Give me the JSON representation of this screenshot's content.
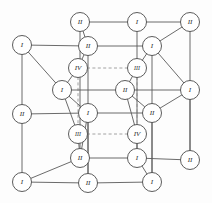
{
  "figure": {
    "background_color": "#fdfdfd",
    "edge_color": "#5a5a5a",
    "dashed_edge_color": "#8a8a8a",
    "node_fill": "#ffffff",
    "node_stroke": "#4a4a4a",
    "label_color": "#2b2b2b"
  },
  "chart_data": {
    "type": "diagram",
    "xlabel": "",
    "ylabel": "",
    "nodes": [
      {
        "id": "n01",
        "label": "II",
        "x": 80,
        "y": 22,
        "r": 9.5,
        "group": "outer-top-back-left"
      },
      {
        "id": "n02",
        "label": "I",
        "x": 137,
        "y": 22,
        "r": 9.5,
        "group": "outer-top-back-center"
      },
      {
        "id": "n03",
        "label": "II",
        "x": 190,
        "y": 22,
        "r": 9.5,
        "group": "outer-top-back-right"
      },
      {
        "id": "n04",
        "label": "I",
        "x": 22,
        "y": 45,
        "r": 9.5,
        "group": "outer-top-front-left"
      },
      {
        "id": "n05",
        "label": "II",
        "x": 88,
        "y": 46,
        "r": 9.5,
        "group": "outer-top-front-center"
      },
      {
        "id": "n06",
        "label": "I",
        "x": 152,
        "y": 46,
        "r": 9.5,
        "group": "outer-top-front-right"
      },
      {
        "id": "n07",
        "label": "IV",
        "x": 78,
        "y": 68,
        "r": 9.5,
        "group": "inner-top-back-left"
      },
      {
        "id": "n08",
        "label": "III",
        "x": 137,
        "y": 68,
        "r": 9.5,
        "group": "inner-top-back-right"
      },
      {
        "id": "n09",
        "label": "I",
        "x": 62,
        "y": 90,
        "r": 9.5,
        "group": "inner-mid-back-left"
      },
      {
        "id": "n10",
        "label": "II",
        "x": 125,
        "y": 90,
        "r": 9.5,
        "group": "inner-mid-back-right"
      },
      {
        "id": "n11",
        "label": "I",
        "x": 190,
        "y": 90,
        "r": 9.5,
        "group": "outer-mid-back-right"
      },
      {
        "id": "n12",
        "label": "II",
        "x": 22,
        "y": 114,
        "r": 9.5,
        "group": "outer-mid-front-left"
      },
      {
        "id": "n13",
        "label": "I",
        "x": 88,
        "y": 113,
        "r": 9.5,
        "group": "inner-mid-front-center"
      },
      {
        "id": "n14",
        "label": "II",
        "x": 152,
        "y": 113,
        "r": 9.5,
        "group": "outer-mid-front-right"
      },
      {
        "id": "n15",
        "label": "III",
        "x": 78,
        "y": 134,
        "r": 9.5,
        "group": "inner-bottom-back-left"
      },
      {
        "id": "n16",
        "label": "IV",
        "x": 137,
        "y": 134,
        "r": 9.5,
        "group": "inner-bottom-back-right"
      },
      {
        "id": "n17",
        "label": "II",
        "x": 80,
        "y": 158,
        "r": 9.5,
        "group": "outer-bottom-back-left"
      },
      {
        "id": "n18",
        "label": "I",
        "x": 137,
        "y": 158,
        "r": 9.5,
        "group": "outer-bottom-back-center"
      },
      {
        "id": "n19",
        "label": "II",
        "x": 190,
        "y": 160,
        "r": 9.5,
        "group": "outer-bottom-back-right"
      },
      {
        "id": "n20",
        "label": "I",
        "x": 22,
        "y": 182,
        "r": 9.5,
        "group": "outer-bottom-front-left"
      },
      {
        "id": "n21",
        "label": "II",
        "x": 88,
        "y": 183,
        "r": 9.5,
        "group": "outer-bottom-front-center"
      },
      {
        "id": "n22",
        "label": "I",
        "x": 152,
        "y": 182,
        "r": 9.5,
        "group": "outer-bottom-front-right"
      }
    ],
    "edges": [
      {
        "from": "n01",
        "to": "n02",
        "style": "solid"
      },
      {
        "from": "n02",
        "to": "n03",
        "style": "solid"
      },
      {
        "from": "n01",
        "to": "n05",
        "style": "solid"
      },
      {
        "from": "n04",
        "to": "n05",
        "style": "solid"
      },
      {
        "from": "n05",
        "to": "n06",
        "style": "solid"
      },
      {
        "from": "n06",
        "to": "n03",
        "style": "solid"
      },
      {
        "from": "n04",
        "to": "n12",
        "style": "solid"
      },
      {
        "from": "n12",
        "to": "n20",
        "style": "solid"
      },
      {
        "from": "n01",
        "to": "n17",
        "style": "solid"
      },
      {
        "from": "n02",
        "to": "n18",
        "style": "solid"
      },
      {
        "from": "n03",
        "to": "n19",
        "style": "solid"
      },
      {
        "from": "n05",
        "to": "n21",
        "style": "solid"
      },
      {
        "from": "n06",
        "to": "n22",
        "style": "solid"
      },
      {
        "from": "n11",
        "to": "n19",
        "style": "solid"
      },
      {
        "from": "n17",
        "to": "n18",
        "style": "solid"
      },
      {
        "from": "n18",
        "to": "n19",
        "style": "solid"
      },
      {
        "from": "n20",
        "to": "n21",
        "style": "solid"
      },
      {
        "from": "n21",
        "to": "n22",
        "style": "solid"
      },
      {
        "from": "n20",
        "to": "n17",
        "style": "solid"
      },
      {
        "from": "n22",
        "to": "n18",
        "style": "solid"
      },
      {
        "from": "n07",
        "to": "n08",
        "style": "dashed"
      },
      {
        "from": "n15",
        "to": "n16",
        "style": "dashed"
      },
      {
        "from": "n07",
        "to": "n15",
        "style": "dashed"
      },
      {
        "from": "n08",
        "to": "n16",
        "style": "dashed"
      },
      {
        "from": "n09",
        "to": "n10",
        "style": "solid"
      },
      {
        "from": "n10",
        "to": "n11",
        "style": "solid"
      },
      {
        "from": "n09",
        "to": "n13",
        "style": "solid"
      },
      {
        "from": "n13",
        "to": "n14",
        "style": "solid"
      },
      {
        "from": "n10",
        "to": "n14",
        "style": "solid"
      },
      {
        "from": "n12",
        "to": "n13",
        "style": "solid"
      },
      {
        "from": "n04",
        "to": "n09",
        "style": "solid"
      },
      {
        "from": "n09",
        "to": "n15",
        "style": "solid"
      },
      {
        "from": "n07",
        "to": "n09",
        "style": "solid"
      },
      {
        "from": "n10",
        "to": "n08",
        "style": "solid"
      },
      {
        "from": "n10",
        "to": "n16",
        "style": "solid"
      },
      {
        "from": "n05",
        "to": "n07",
        "style": "solid"
      },
      {
        "from": "n06",
        "to": "n08",
        "style": "solid"
      },
      {
        "from": "n13",
        "to": "n21",
        "style": "solid"
      },
      {
        "from": "n15",
        "to": "n17",
        "style": "solid"
      },
      {
        "from": "n16",
        "to": "n18",
        "style": "solid"
      },
      {
        "from": "n14",
        "to": "n22",
        "style": "solid"
      },
      {
        "from": "n11",
        "to": "n06",
        "style": "solid"
      },
      {
        "from": "n13",
        "to": "n17",
        "style": "solid"
      },
      {
        "from": "n14",
        "to": "n11",
        "style": "solid"
      }
    ],
    "labels_legend": [
      "I",
      "II",
      "III",
      "IV"
    ]
  }
}
